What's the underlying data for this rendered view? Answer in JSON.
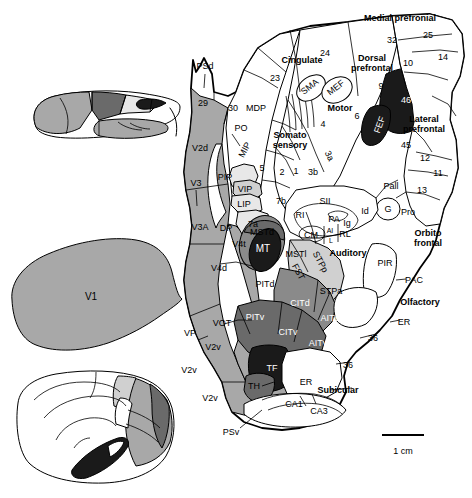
{
  "figure": {
    "type": "macaque-cortical-flat-map",
    "scale_bar": {
      "label": "1 cm",
      "length_px": 42
    }
  },
  "palette": {
    "white": "#ffffff",
    "very_light_gray": "#e8e8e8",
    "light_gray": "#d0d0d0",
    "medium_gray": "#a8a8a8",
    "mid_dark_gray": "#8a8a8a",
    "dark_gray": "#6a6a6a",
    "near_black": "#1a1a1a",
    "outline": "#000000"
  },
  "group_labels": [
    {
      "name": "medial-prefrontal",
      "text": "Medial prefronial",
      "x": 400,
      "y": 18
    },
    {
      "name": "dorsal-prefrontal",
      "text": "Dorsal\nprefrontal",
      "x": 372,
      "y": 63
    },
    {
      "name": "lateral-prefrontal",
      "text": "Lateral\nprefrontal",
      "x": 424,
      "y": 124
    },
    {
      "name": "cingulate",
      "text": "Cingulate",
      "x": 302,
      "y": 60
    },
    {
      "name": "motor",
      "text": "Motor",
      "x": 340,
      "y": 108
    },
    {
      "name": "somato-sensory",
      "text": "Somato\nsensory",
      "x": 290,
      "y": 140
    },
    {
      "name": "auditory",
      "text": "Auditory",
      "x": 348,
      "y": 253
    },
    {
      "name": "orbito-frontal",
      "text": "Orbito\nfrontal",
      "x": 428,
      "y": 238
    },
    {
      "name": "olfactory",
      "text": "Olfactory",
      "x": 420,
      "y": 302
    },
    {
      "name": "subicular",
      "text": "Subicular",
      "x": 338,
      "y": 390
    }
  ],
  "area_labels": [
    {
      "name": "area-psd",
      "text": "PSd",
      "x": 205,
      "y": 66,
      "color": "black"
    },
    {
      "name": "area-29",
      "text": "29",
      "x": 203,
      "y": 103,
      "color": "black"
    },
    {
      "name": "area-30",
      "text": "30",
      "x": 233,
      "y": 108,
      "color": "black"
    },
    {
      "name": "area-mdp",
      "text": "MDP",
      "x": 256,
      "y": 108,
      "color": "black"
    },
    {
      "name": "area-po",
      "text": "PO",
      "x": 241,
      "y": 128,
      "color": "black"
    },
    {
      "name": "area-mip",
      "text": "MIP",
      "x": 245,
      "y": 150,
      "color": "black",
      "rotate": -62
    },
    {
      "name": "area-v2d",
      "text": "V2d",
      "x": 200,
      "y": 148,
      "color": "black"
    },
    {
      "name": "area-v3",
      "text": "V3",
      "x": 196,
      "y": 183,
      "color": "black"
    },
    {
      "name": "area-pip",
      "text": "PIP",
      "x": 225,
      "y": 177,
      "color": "black"
    },
    {
      "name": "area-vip",
      "text": "VIP",
      "x": 245,
      "y": 189,
      "color": "black"
    },
    {
      "name": "area-lip",
      "text": "LIP",
      "x": 244,
      "y": 204,
      "color": "black"
    },
    {
      "name": "area-5",
      "text": "5",
      "x": 262,
      "y": 168,
      "color": "black"
    },
    {
      "name": "area-v3a",
      "text": "V3A",
      "x": 200,
      "y": 227,
      "color": "black"
    },
    {
      "name": "area-dp",
      "text": "DP",
      "x": 226,
      "y": 228,
      "color": "black"
    },
    {
      "name": "area-7a",
      "text": "7a",
      "x": 253,
      "y": 224,
      "color": "black"
    },
    {
      "name": "area-7b",
      "text": "7b",
      "x": 281,
      "y": 201,
      "color": "black"
    },
    {
      "name": "area-2",
      "text": "2",
      "x": 282,
      "y": 172,
      "color": "black"
    },
    {
      "name": "area-1",
      "text": "1",
      "x": 296,
      "y": 171,
      "color": "black"
    },
    {
      "name": "area-3b",
      "text": "3b",
      "x": 313,
      "y": 172,
      "color": "black"
    },
    {
      "name": "area-3a",
      "text": "3a",
      "x": 329,
      "y": 156,
      "color": "black",
      "rotate": 62
    },
    {
      "name": "area-4",
      "text": "4",
      "x": 323,
      "y": 124,
      "color": "black"
    },
    {
      "name": "area-6",
      "text": "6",
      "x": 357,
      "y": 116,
      "color": "black"
    },
    {
      "name": "area-sma",
      "text": "SMA",
      "x": 310,
      "y": 87,
      "color": "black",
      "rotate": -38
    },
    {
      "name": "area-mef",
      "text": "MEF",
      "x": 336,
      "y": 88,
      "color": "black",
      "rotate": -38
    },
    {
      "name": "area-23",
      "text": "23",
      "x": 275,
      "y": 78,
      "color": "black"
    },
    {
      "name": "area-24",
      "text": "24",
      "x": 325,
      "y": 53,
      "color": "black"
    },
    {
      "name": "area-32",
      "text": "32",
      "x": 392,
      "y": 40,
      "color": "black"
    },
    {
      "name": "area-25",
      "text": "25",
      "x": 428,
      "y": 35,
      "color": "black"
    },
    {
      "name": "area-14",
      "text": "14",
      "x": 443,
      "y": 57,
      "color": "black"
    },
    {
      "name": "area-10",
      "text": "10",
      "x": 408,
      "y": 63,
      "color": "black"
    },
    {
      "name": "area-9",
      "text": "9",
      "x": 381,
      "y": 86,
      "color": "black"
    },
    {
      "name": "area-46",
      "text": "46",
      "x": 406,
      "y": 100,
      "color": "white"
    },
    {
      "name": "area-fef",
      "text": "FEF",
      "x": 380,
      "y": 125,
      "color": "white",
      "rotate": -70
    },
    {
      "name": "area-45",
      "text": "45",
      "x": 406,
      "y": 145,
      "color": "black"
    },
    {
      "name": "area-12",
      "text": "12",
      "x": 425,
      "y": 158,
      "color": "black"
    },
    {
      "name": "area-11",
      "text": "11",
      "x": 438,
      "y": 173,
      "color": "black"
    },
    {
      "name": "area-13",
      "text": "13",
      "x": 422,
      "y": 190,
      "color": "black"
    },
    {
      "name": "area-pall",
      "text": "Pall",
      "x": 391,
      "y": 186,
      "color": "black"
    },
    {
      "name": "area-g",
      "text": "G",
      "x": 388,
      "y": 209,
      "color": "black"
    },
    {
      "name": "area-pro",
      "text": "Pro",
      "x": 408,
      "y": 212,
      "color": "black"
    },
    {
      "name": "area-id",
      "text": "Id",
      "x": 365,
      "y": 211,
      "color": "black"
    },
    {
      "name": "area-ig",
      "text": "Ig",
      "x": 347,
      "y": 223,
      "color": "black"
    },
    {
      "name": "area-pa",
      "text": "PA",
      "x": 334,
      "y": 219,
      "color": "black"
    },
    {
      "name": "area-ai",
      "text": "AI",
      "x": 330,
      "y": 230,
      "color": "black",
      "size": 7
    },
    {
      "name": "area-l",
      "text": "L",
      "x": 331,
      "y": 240,
      "color": "black",
      "size": 7
    },
    {
      "name": "area-rl",
      "text": "RL",
      "x": 345,
      "y": 234,
      "color": "black"
    },
    {
      "name": "area-cm",
      "text": "CM",
      "x": 311,
      "y": 235,
      "color": "black"
    },
    {
      "name": "area-ri",
      "text": "RI",
      "x": 300,
      "y": 215,
      "color": "black"
    },
    {
      "name": "area-sii",
      "text": "SII",
      "x": 325,
      "y": 201,
      "color": "black"
    },
    {
      "name": "area-mstd",
      "text": "MSTd",
      "x": 262,
      "y": 232,
      "color": "black"
    },
    {
      "name": "area-mt",
      "text": "MT",
      "x": 263,
      "y": 248,
      "color": "white",
      "size": 10
    },
    {
      "name": "area-mstl",
      "text": "MSTl",
      "x": 296,
      "y": 254,
      "color": "black"
    },
    {
      "name": "area-fst",
      "text": "FST",
      "x": 298,
      "y": 272,
      "color": "black",
      "rotate": 62
    },
    {
      "name": "area-stpp",
      "text": "STPp",
      "x": 320,
      "y": 262,
      "color": "black",
      "rotate": 62
    },
    {
      "name": "area-stpa",
      "text": "STPa",
      "x": 331,
      "y": 291,
      "color": "black"
    },
    {
      "name": "area-v4t",
      "text": "V4t",
      "x": 239,
      "y": 244,
      "color": "black"
    },
    {
      "name": "area-v4d",
      "text": "V4d",
      "x": 219,
      "y": 268,
      "color": "black"
    },
    {
      "name": "area-pitd",
      "text": "PITd",
      "x": 265,
      "y": 284,
      "color": "black"
    },
    {
      "name": "area-citd",
      "text": "CITd",
      "x": 300,
      "y": 303,
      "color": "white"
    },
    {
      "name": "area-aitd",
      "text": "AITd",
      "x": 330,
      "y": 318,
      "color": "white"
    },
    {
      "name": "area-pitv",
      "text": "PITv",
      "x": 255,
      "y": 317,
      "color": "white"
    },
    {
      "name": "area-citv",
      "text": "CITv",
      "x": 288,
      "y": 332,
      "color": "white"
    },
    {
      "name": "area-aitv",
      "text": "AITv",
      "x": 318,
      "y": 343,
      "color": "white"
    },
    {
      "name": "area-vot",
      "text": "VOT",
      "x": 222,
      "y": 323,
      "color": "black"
    },
    {
      "name": "area-vp",
      "text": "VP",
      "x": 190,
      "y": 333,
      "color": "black"
    },
    {
      "name": "area-v2v-1",
      "text": "V2v",
      "x": 213,
      "y": 347,
      "color": "black"
    },
    {
      "name": "area-v2v-2",
      "text": "V2v",
      "x": 189,
      "y": 370,
      "color": "black"
    },
    {
      "name": "area-v2v-3",
      "text": "V2v",
      "x": 210,
      "y": 398,
      "color": "black"
    },
    {
      "name": "area-tf",
      "text": "TF",
      "x": 272,
      "y": 368,
      "color": "white"
    },
    {
      "name": "area-th",
      "text": "TH",
      "x": 254,
      "y": 386,
      "color": "black"
    },
    {
      "name": "area-er-1",
      "text": "ER",
      "x": 306,
      "y": 382,
      "color": "black"
    },
    {
      "name": "area-er-2",
      "text": "ER",
      "x": 404,
      "y": 322,
      "color": "black"
    },
    {
      "name": "area-ca1",
      "text": "CA1",
      "x": 294,
      "y": 404,
      "color": "black"
    },
    {
      "name": "area-ca3",
      "text": "CA3",
      "x": 319,
      "y": 411,
      "color": "black"
    },
    {
      "name": "area-psv",
      "text": "PSv",
      "x": 231,
      "y": 432,
      "color": "black"
    },
    {
      "name": "area-pir",
      "text": "PIR",
      "x": 385,
      "y": 263,
      "color": "black"
    },
    {
      "name": "area-pac",
      "text": "PAC",
      "x": 414,
      "y": 280,
      "color": "black"
    },
    {
      "name": "area-36-1",
      "text": "36",
      "x": 373,
      "y": 338,
      "color": "black"
    },
    {
      "name": "area-36-2",
      "text": "36",
      "x": 348,
      "y": 365,
      "color": "black"
    },
    {
      "name": "area-v1",
      "text": "V1",
      "x": 91,
      "y": 296,
      "color": "black",
      "size": 10
    }
  ],
  "insets": [
    {
      "name": "lateral-view-inset",
      "position": "top-left"
    },
    {
      "name": "medial-view-inset",
      "position": "bottom-left"
    }
  ]
}
